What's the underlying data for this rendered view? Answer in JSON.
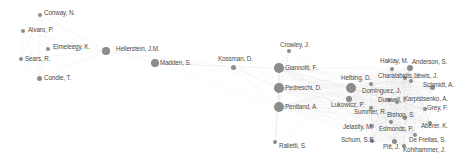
{
  "diagram": {
    "type": "co-authorship network",
    "colors": {
      "node": "#8c8c8c",
      "edge": "#d6d6d6",
      "label": "#4a4a4a",
      "background": "#ffffff"
    },
    "nodes": [
      {
        "id": "conway",
        "label": "Conway, N.",
        "x": 40,
        "y": 15,
        "r": 2.2,
        "lx": 44,
        "ly": 10
      },
      {
        "id": "alvaro",
        "label": "Alvaro, P.",
        "x": 23,
        "y": 31,
        "r": 2.2,
        "lx": 28,
        "ly": 27
      },
      {
        "id": "elmeleegy",
        "label": "Elmeleegy, K.",
        "x": 48,
        "y": 49,
        "r": 2.3,
        "lx": 53,
        "ly": 44
      },
      {
        "id": "sears",
        "label": "Sears, R.",
        "x": 21,
        "y": 59,
        "r": 2.2,
        "lx": 25,
        "ly": 56
      },
      {
        "id": "condie",
        "label": "Condie, T.",
        "x": 39,
        "y": 78,
        "r": 2.5,
        "lx": 44,
        "ly": 75
      },
      {
        "id": "hellerstein",
        "label": "Hellerstein, J.M.",
        "x": 106,
        "y": 51,
        "r": 3.8,
        "lx": 116,
        "ly": 46
      },
      {
        "id": "madden",
        "label": "Madden, S.",
        "x": 155,
        "y": 63,
        "r": 3.8,
        "lx": 160,
        "ly": 60
      },
      {
        "id": "kossman",
        "label": "Kossman, D.",
        "x": 233,
        "y": 67,
        "r": 2.5,
        "lx": 218,
        "ly": 56
      },
      {
        "id": "crowley",
        "label": "Crowley, J.",
        "x": 289,
        "y": 51,
        "r": 2.3,
        "lx": 280,
        "ly": 42
      },
      {
        "id": "giannotti",
        "label": "Giannotti, F.",
        "x": 279,
        "y": 68,
        "r": 4.8,
        "lx": 285,
        "ly": 65
      },
      {
        "id": "pedreschi",
        "label": "Pedreschi, D.",
        "x": 279,
        "y": 88,
        "r": 4.8,
        "lx": 285,
        "ly": 85
      },
      {
        "id": "pentland",
        "label": "Pentland, A.",
        "x": 279,
        "y": 107,
        "r": 5.2,
        "lx": 285,
        "ly": 104
      },
      {
        "id": "ralietti",
        "label": "Ralietti, S.",
        "x": 275,
        "y": 142,
        "r": 2.2,
        "lx": 279,
        "ly": 143
      },
      {
        "id": "helbing",
        "label": "Helbing, D.",
        "x": 351,
        "y": 88,
        "r": 5.2,
        "lx": 341,
        "ly": 75
      },
      {
        "id": "lukowicz",
        "label": "Lukowicz, P.",
        "x": 349,
        "y": 99,
        "r": 3.0,
        "lx": 331,
        "ly": 102
      },
      {
        "id": "haklay",
        "label": "Haklay, M.",
        "x": 392,
        "y": 69,
        "r": 2.0,
        "lx": 380,
        "ly": 58
      },
      {
        "id": "anderson",
        "label": "Anderson, S.",
        "x": 410,
        "y": 68,
        "r": 3.0,
        "lx": 412,
        "ly": 59
      },
      {
        "id": "charalabidis",
        "label": "Charalabidis, Y.",
        "x": 405,
        "y": 78,
        "r": 2.0,
        "lx": 378,
        "ly": 73
      },
      {
        "id": "lewis",
        "label": "Lewis, J.",
        "x": 411,
        "y": 81,
        "r": 2.0,
        "lx": 414,
        "ly": 73
      },
      {
        "id": "schmidt",
        "label": "Schmidt, A.",
        "x": 432,
        "y": 87,
        "r": 2.5,
        "lx": 423,
        "ly": 82
      },
      {
        "id": "dominguez",
        "label": "Dominguez, J.",
        "x": 371,
        "y": 84,
        "r": 2.2,
        "lx": 362,
        "ly": 88
      },
      {
        "id": "dunwell",
        "label": "Dunwell, I.",
        "x": 389,
        "y": 100,
        "r": 2.2,
        "lx": 378,
        "ly": 97
      },
      {
        "id": "karpistsenko",
        "label": "Karpistsenko, A.",
        "x": 397,
        "y": 102,
        "r": 2.2,
        "lx": 404,
        "ly": 96
      },
      {
        "id": "summer",
        "label": "Summer, R.",
        "x": 371,
        "y": 108,
        "r": 2.0,
        "lx": 354,
        "ly": 109
      },
      {
        "id": "bishop",
        "label": "Bishop, S.",
        "x": 405,
        "y": 118,
        "r": 2.2,
        "lx": 387,
        "ly": 112
      },
      {
        "id": "grey",
        "label": "Grey, F.",
        "x": 425,
        "y": 109,
        "r": 2.0,
        "lx": 427,
        "ly": 105
      },
      {
        "id": "lelasity",
        "label": "Jelasity, M.",
        "x": 372,
        "y": 126,
        "r": 2.0,
        "lx": 343,
        "ly": 124
      },
      {
        "id": "edmonds",
        "label": "Edmonds, P.",
        "x": 391,
        "y": 122,
        "r": 2.0,
        "lx": 379,
        "ly": 126
      },
      {
        "id": "aberer",
        "label": "Aberer, K.",
        "x": 430,
        "y": 123,
        "r": 2.0,
        "lx": 421,
        "ly": 123
      },
      {
        "id": "schum",
        "label": "Schum, S.B.",
        "x": 372,
        "y": 141,
        "r": 2.0,
        "lx": 341,
        "ly": 137
      },
      {
        "id": "pitt",
        "label": "Pitt, J.",
        "x": 394,
        "y": 141,
        "r": 2.5,
        "lx": 383,
        "ly": 144
      },
      {
        "id": "defreitas",
        "label": "De Freitas, S.",
        "x": 415,
        "y": 135,
        "r": 2.0,
        "lx": 409,
        "ly": 137
      },
      {
        "id": "kohlhammer",
        "label": "Kohlhammer, J.",
        "x": 404,
        "y": 146,
        "r": 2.0,
        "lx": 403,
        "ly": 147
      }
    ]
  }
}
